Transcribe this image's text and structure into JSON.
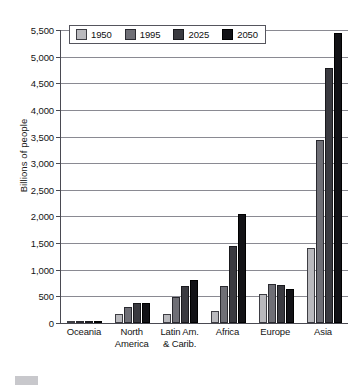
{
  "chart_data": {
    "type": "bar",
    "title": "",
    "xlabel": "",
    "ylabel": "Billions of people",
    "ylim": [
      0,
      5500
    ],
    "grid": true,
    "legend_position": "top-left",
    "y_ticks": [
      "0",
      "500",
      "1,000",
      "1,500",
      "2,000",
      "2,500",
      "3,000",
      "3,500",
      "4,000",
      "4,500",
      "5,000",
      "5,500"
    ],
    "y_tick_values": [
      0,
      500,
      1000,
      1500,
      2000,
      2500,
      3000,
      3500,
      4000,
      4500,
      5000,
      5500
    ],
    "categories": [
      {
        "lines": [
          "Oceania"
        ]
      },
      {
        "lines": [
          "North",
          "America"
        ]
      },
      {
        "lines": [
          "Latin Am.",
          "& Carib."
        ]
      },
      {
        "lines": [
          "Africa"
        ]
      },
      {
        "lines": [
          "Europe"
        ]
      },
      {
        "lines": [
          "Asia"
        ]
      }
    ],
    "category_names": [
      "Oceania",
      "North America",
      "Latin Am. & Carib.",
      "Africa",
      "Europe",
      "Asia"
    ],
    "series": [
      {
        "name": "1950",
        "color": "#b9b9bd",
        "values": [
          13,
          172,
          168,
          224,
          548,
          1402
        ]
      },
      {
        "name": "1995",
        "color": "#6f6f76",
        "values": [
          28,
          297,
          482,
          700,
          727,
          3444
        ]
      },
      {
        "name": "2025",
        "color": "#3a3a40",
        "values": [
          41,
          370,
          701,
          1453,
          718,
          4792
        ]
      },
      {
        "name": "2050",
        "color": "#121216",
        "values": [
          46,
          384,
          810,
          2046,
          638,
          5443
        ]
      }
    ]
  }
}
